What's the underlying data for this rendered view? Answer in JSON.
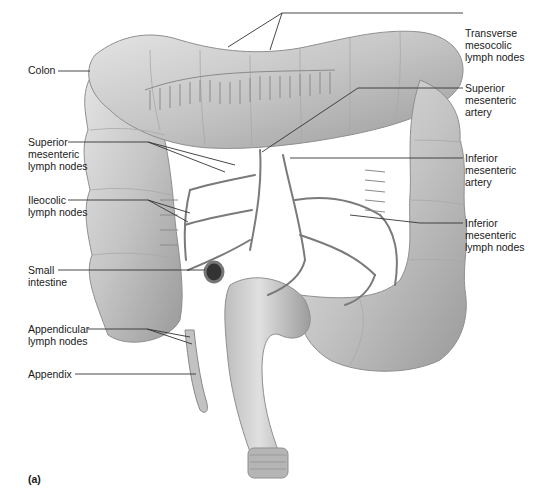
{
  "figure": {
    "panel_label": "(a)",
    "colors": {
      "background": "#ffffff",
      "colon_fill": "#c8c8c8",
      "colon_shadow": "#8f8f8f",
      "vessel": "#7a7a7a",
      "leader_line": "#333333",
      "text": "#1a1a1a"
    },
    "labels_left": [
      {
        "id": "colon",
        "text": "Colon"
      },
      {
        "id": "superior-mesenteric-lymph-nodes",
        "text": "Superior\nmesenteric\nlymph nodes"
      },
      {
        "id": "ileocolic-lymph-nodes",
        "text": "Ileocolic\nlymph nodes"
      },
      {
        "id": "small-intestine",
        "text": "Small\nintestine"
      },
      {
        "id": "appendicular-lymph-nodes",
        "text": "Appendicular\nlymph nodes"
      },
      {
        "id": "appendix",
        "text": "Appendix"
      }
    ],
    "labels_right": [
      {
        "id": "transverse-mesocolic-lymph-nodes",
        "text": "Transverse\nmesocolic\nlymph nodes"
      },
      {
        "id": "superior-mesenteric-artery",
        "text": "Superior\nmesenteric\nartery"
      },
      {
        "id": "inferior-mesenteric-artery",
        "text": "Inferior\nmesenteric\nartery"
      },
      {
        "id": "inferior-mesenteric-lymph-nodes",
        "text": "Inferior\nmesenteric\nlymph nodes"
      }
    ]
  }
}
